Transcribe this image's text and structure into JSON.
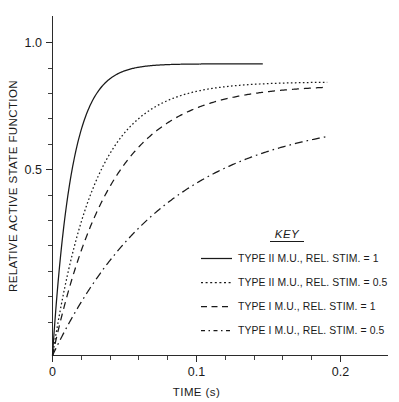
{
  "chart_data": {
    "type": "line",
    "title": "",
    "xlabel": "TIME (s)",
    "ylabel": "RELATIVE ACTIVE STATE FUNCTION",
    "xlim": [
      0,
      0.2345
    ],
    "ylim": [
      0,
      1.135
    ],
    "xticks": [
      0,
      0.1,
      0.2
    ],
    "xticklabels": [
      "0",
      "0.1",
      "0.2"
    ],
    "yticks": [
      0.5,
      1.0
    ],
    "yticklabels": [
      "0.5",
      "1.0"
    ],
    "x_minor_ticks": [
      0.02,
      0.04,
      0.06,
      0.08,
      0.12,
      0.14,
      0.16,
      0.18
    ],
    "y_minor_ticks": [
      0.1,
      0.2,
      0.3,
      0.4,
      0.6,
      0.7,
      0.8,
      0.9
    ],
    "grid": false,
    "legend_position": "lower-right",
    "legend_title": "KEY",
    "x": [
      0,
      0.005,
      0.01,
      0.015,
      0.02,
      0.025,
      0.03,
      0.035,
      0.04,
      0.05,
      0.06,
      0.07,
      0.08,
      0.09,
      0.1,
      0.11,
      0.12,
      0.13,
      0.14,
      0.15,
      0.16,
      0.17,
      0.18,
      0.19
    ],
    "series": [
      {
        "name": "TYPE II M.U., REL. STIM. = 1",
        "linestyle": "solid",
        "tau": 0.0135,
        "amplitude": 0.975,
        "x_end": 0.147,
        "values": [
          0,
          0.304,
          0.517,
          0.665,
          0.769,
          0.841,
          0.892,
          0.927,
          0.951,
          0.9756,
          0.9877,
          0.9938,
          0.9969,
          0.9984,
          0.9992,
          0.9996,
          0.9998,
          0.9999,
          1.0,
          null,
          null,
          null,
          null,
          null
        ]
      },
      {
        "name": "TYPE II M.U., REL. STIM. = 0.5",
        "linestyle": "dotted",
        "tau": 0.03,
        "amplitude": 0.915,
        "x_end": 0.192,
        "values": [
          0,
          0.154,
          0.283,
          0.393,
          0.487,
          0.565,
          0.632,
          0.689,
          0.736,
          0.811,
          0.865,
          0.901,
          0.93,
          0.95,
          0.965,
          0.976,
          0.983,
          0.988,
          0.991,
          0.994,
          0.996,
          0.997,
          0.998,
          0.999
        ]
      },
      {
        "name": "TYPE I M.U., REL. STIM. = 1",
        "linestyle": "dashed",
        "tau": 0.041,
        "amplitude": 0.905,
        "x_end": 0.192,
        "values": [
          0,
          0.115,
          0.216,
          0.306,
          0.386,
          0.456,
          0.518,
          0.573,
          0.622,
          0.705,
          0.77,
          0.82,
          0.859,
          0.89,
          0.914,
          0.933,
          0.948,
          0.959,
          0.968,
          0.975,
          0.98,
          0.985,
          0.988,
          0.991
        ]
      },
      {
        "name": "TYPE I M.U., REL. STIM. = 0.5",
        "linestyle": "dashdot",
        "tau": 0.08,
        "amplitude": 0.805,
        "x_end": 0.193,
        "values": [
          0,
          0.061,
          0.118,
          0.171,
          0.221,
          0.268,
          0.313,
          0.354,
          0.394,
          0.465,
          0.528,
          0.583,
          0.632,
          0.675,
          0.714,
          0.747,
          0.777,
          0.803,
          0.826,
          0.847,
          0.865,
          0.881,
          0.895,
          0.907
        ]
      }
    ]
  },
  "axes": {
    "y_label": "RELATIVE ACTIVE STATE FUNCTION",
    "x_label": "TIME (s)",
    "y_tick_1": "1.0",
    "y_tick_2": "0.5",
    "x_tick_1": "0",
    "x_tick_2": "0.1",
    "x_tick_3": "0.2"
  },
  "legend": {
    "title": "KEY",
    "items": [
      {
        "label": "TYPE II M.U., REL. STIM. = 1",
        "style": "solid"
      },
      {
        "label": "TYPE II M.U., REL. STIM. = 0.5",
        "style": "dotted"
      },
      {
        "label": "TYPE I M.U., REL. STIM. = 1",
        "style": "dashed"
      },
      {
        "label": "TYPE I M.U., REL. STIM. = 0.5",
        "style": "dashdot"
      }
    ]
  },
  "colors": {
    "ink": "#1a1a1a",
    "axis": "#2b2b2b",
    "background": "#ffffff"
  }
}
